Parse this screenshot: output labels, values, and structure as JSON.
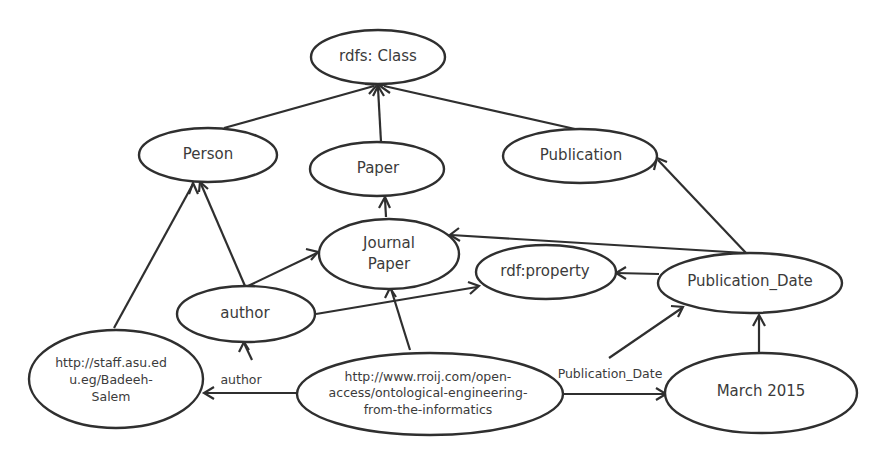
{
  "diagram": {
    "type": "rdf-graph",
    "colors": {
      "stroke": "#2f2f2f",
      "text": "#3b3b3b",
      "background": "#ffffff"
    },
    "nodes": [
      {
        "id": "rdfs_class",
        "label": "rdfs: Class"
      },
      {
        "id": "person",
        "label": "Person"
      },
      {
        "id": "paper",
        "label": "Paper"
      },
      {
        "id": "publication",
        "label": "Publication"
      },
      {
        "id": "journal_paper",
        "label": "Journal\nPaper"
      },
      {
        "id": "rdf_property",
        "label": "rdf:property"
      },
      {
        "id": "publication_date",
        "label": "Publication_Date"
      },
      {
        "id": "author",
        "label": "author"
      },
      {
        "id": "badeeh",
        "label": "http://staff.asu.ed\nu.eg/Badeeh-\nSalem"
      },
      {
        "id": "rroij",
        "label": "http://www.rroij.com/open-\naccess/ontological-engineering-\nfrom-the-informatics"
      },
      {
        "id": "march_2015",
        "label": "March 2015"
      }
    ],
    "edges": [
      {
        "from": "person",
        "to": "rdfs_class",
        "label": ""
      },
      {
        "from": "paper",
        "to": "rdfs_class",
        "label": ""
      },
      {
        "from": "publication",
        "to": "rdfs_class",
        "label": ""
      },
      {
        "from": "journal_paper",
        "to": "paper",
        "label": ""
      },
      {
        "from": "author",
        "to": "person",
        "label": ""
      },
      {
        "from": "badeeh",
        "to": "person",
        "label": ""
      },
      {
        "from": "author",
        "to": "journal_paper",
        "label": ""
      },
      {
        "from": "author",
        "to": "rdf_property",
        "label": ""
      },
      {
        "from": "publication_date",
        "to": "journal_paper",
        "label": ""
      },
      {
        "from": "publication_date",
        "to": "publication",
        "label": ""
      },
      {
        "from": "publication_date",
        "to": "rdf_property",
        "label": ""
      },
      {
        "from": "rroij",
        "to": "journal_paper",
        "label": ""
      },
      {
        "from": "rroij",
        "to": "badeeh",
        "label": "author"
      },
      {
        "from": "rroij",
        "to": "march_2015",
        "label": "Publication_Date"
      },
      {
        "from": "march_2015",
        "to": "publication_date",
        "label": ""
      }
    ],
    "edge_labels": {
      "author": "author",
      "publication_date": "Publication_Date"
    }
  }
}
